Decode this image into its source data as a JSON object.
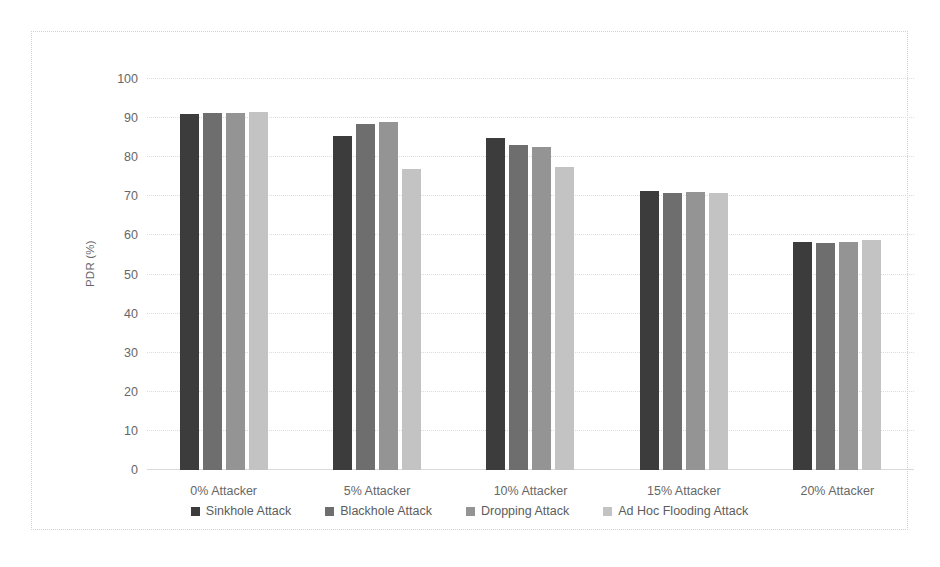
{
  "chart_data": {
    "type": "bar",
    "title": "",
    "xlabel": "",
    "ylabel": "PDR (%)",
    "ylim": [
      0,
      100
    ],
    "ytick_step": 10,
    "yticks": [
      100,
      90,
      80,
      70,
      60,
      50,
      40,
      30,
      20,
      10,
      0
    ],
    "grid": true,
    "legend_position": "bottom",
    "categories": [
      "0% Attacker",
      "5% Attacker",
      "10% Attacker",
      "15% Attacker",
      "20% Attacker"
    ],
    "series": [
      {
        "name": "Sinkhole Attack",
        "color": "#3c3c3c",
        "values": [
          91.0,
          85.3,
          84.8,
          71.4,
          58.3
        ]
      },
      {
        "name": "Blackhole Attack",
        "color": "#6e6e6e",
        "values": [
          91.2,
          88.5,
          83.2,
          70.9,
          58.0
        ]
      },
      {
        "name": "Dropping Attack",
        "color": "#949494",
        "values": [
          91.3,
          89.0,
          82.5,
          71.0,
          58.4
        ]
      },
      {
        "name": "Ad Hoc Flooding Attack",
        "color": "#c3c3c3",
        "values": [
          91.5,
          77.0,
          77.4,
          70.8,
          58.9
        ]
      }
    ]
  }
}
